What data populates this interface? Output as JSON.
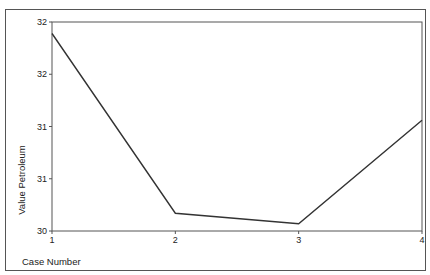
{
  "chart_data": {
    "type": "line",
    "title": "",
    "xlabel": "Case Number",
    "ylabel": "Value Petroleum",
    "x": [
      1,
      2,
      3,
      4
    ],
    "x_tick_labels": [
      "1",
      "2",
      "3",
      "4"
    ],
    "series": [
      {
        "name": "Value Petroleum",
        "values": [
          31.89,
          30.17,
          30.07,
          31.06
        ]
      }
    ],
    "y_ticks": [
      30,
      30.5,
      31,
      31.5,
      32
    ],
    "y_tick_labels": [
      "30",
      "31",
      "31",
      "32",
      "32"
    ],
    "ylim": [
      30,
      32
    ],
    "xlim": [
      1,
      4
    ],
    "grid": false,
    "legend": "none",
    "line_color": "#333333"
  }
}
